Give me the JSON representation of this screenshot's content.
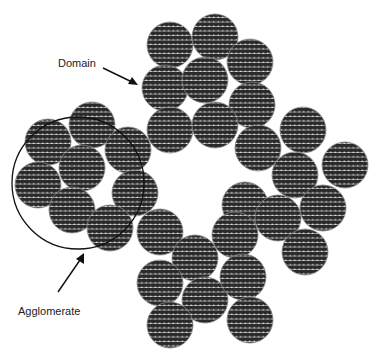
{
  "labels": {
    "domain": "Domain",
    "agglomerate": "Agglomerate"
  },
  "colors": {
    "domain_fill": "#2a2a2a",
    "dot_color": "#ffffff",
    "outline": "#111111",
    "background": "#ffffff"
  },
  "domain_radius": 23,
  "agglomerate": {
    "cx": 78,
    "cy": 183,
    "r": 66
  },
  "domains": [
    [
      48,
      142
    ],
    [
      92,
      125
    ],
    [
      128,
      150
    ],
    [
      82,
      168
    ],
    [
      38,
      185
    ],
    [
      135,
      193
    ],
    [
      72,
      210
    ],
    [
      110,
      228
    ],
    [
      170,
      45
    ],
    [
      215,
      37
    ],
    [
      250,
      62
    ],
    [
      165,
      88
    ],
    [
      205,
      80
    ],
    [
      252,
      105
    ],
    [
      170,
      130
    ],
    [
      215,
      125
    ],
    [
      303,
      130
    ],
    [
      258,
      148
    ],
    [
      345,
      165
    ],
    [
      295,
      175
    ],
    [
      245,
      205
    ],
    [
      323,
      208
    ],
    [
      278,
      218
    ],
    [
      235,
      235
    ],
    [
      305,
      252
    ],
    [
      160,
      232
    ],
    [
      195,
      258
    ],
    [
      160,
      283
    ],
    [
      205,
      300
    ],
    [
      243,
      277
    ],
    [
      170,
      325
    ],
    [
      250,
      320
    ]
  ]
}
